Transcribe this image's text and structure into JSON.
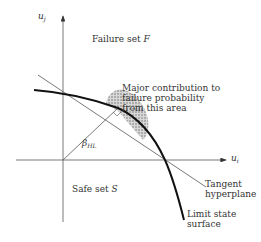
{
  "axes": {
    "vertical_label": "u",
    "vertical_sub": "j",
    "horizontal_label": "u",
    "horizontal_sub": "i"
  },
  "regions": {
    "failure_set": "Failure set ",
    "failure_symbol": "F",
    "safe_set": "Safe set ",
    "safe_symbol": "S"
  },
  "annotations": {
    "major_contribution": [
      "Major contribution to",
      "failure probability",
      "from this area"
    ],
    "beta_label": "β",
    "beta_sub": "HL",
    "tangent": [
      "Tangent",
      "hyperplane"
    ],
    "limit_state": [
      "Limit state",
      "surface"
    ]
  },
  "colors": {
    "line": "#222222",
    "thin_line": "#555555",
    "hatch": "#888888"
  }
}
